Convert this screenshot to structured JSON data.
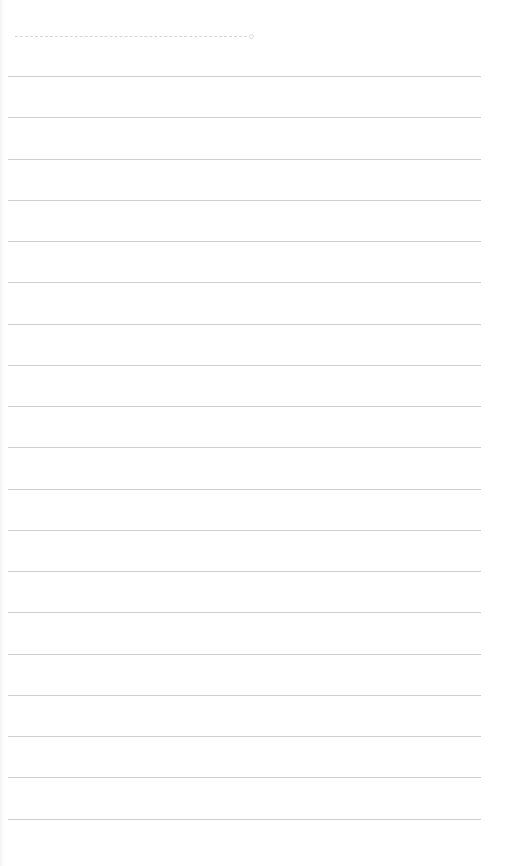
{
  "page": {
    "type": "ruled-notebook-sheet",
    "background_color": "#ffffff",
    "rule_color": "#cfcfcf",
    "header_placeholder": {
      "style": "dashed",
      "color": "#d6d6d6"
    },
    "rules": {
      "count": 19,
      "first_y": 76,
      "spacing": 41.25,
      "x_start": 8,
      "x_end": 481
    }
  }
}
